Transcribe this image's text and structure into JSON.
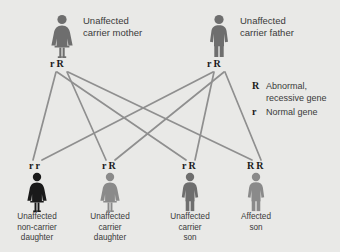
{
  "diagram": {
    "background_color": "#e9e9e7",
    "line_color": "#8f8f8f"
  },
  "parents": [
    {
      "id": "mother",
      "icon": "female-figure-icon",
      "color": "#6e6e6e",
      "genotype": [
        "r",
        "R"
      ],
      "label_line1": "Unaffected",
      "label_line2": "carrier mother"
    },
    {
      "id": "father",
      "icon": "male-figure-icon",
      "color": "#6e6e6e",
      "genotype": [
        "r",
        "R"
      ],
      "label_line1": "Unaffected",
      "label_line2": "carrier father"
    }
  ],
  "children": [
    {
      "id": "child-1",
      "icon": "female-figure-icon",
      "color": "#1a1a1a",
      "genotype": [
        "r",
        "r"
      ],
      "caption_lines": [
        "Unaffected",
        "non-carrier",
        "daughter"
      ]
    },
    {
      "id": "child-2",
      "icon": "female-figure-icon",
      "color": "#8a8a8a",
      "genotype": [
        "r",
        "R"
      ],
      "caption_lines": [
        "Unaffected",
        "carrier",
        "daughter"
      ]
    },
    {
      "id": "child-3",
      "icon": "male-figure-icon",
      "color": "#6e6e6e",
      "genotype": [
        "r",
        "R"
      ],
      "caption_lines": [
        "Unaffected",
        "carrier",
        "son"
      ]
    },
    {
      "id": "child-4",
      "icon": "male-figure-icon",
      "color": "#8a8a8a",
      "genotype": [
        "R",
        "R"
      ],
      "caption_lines": [
        "Affected",
        "son"
      ]
    }
  ],
  "legend": {
    "items": [
      {
        "key": "R",
        "text_line1": "Abnormal,",
        "text_line2": "recessive gene"
      },
      {
        "key": "r",
        "text_line1": "Normal gene",
        "text_line2": ""
      }
    ]
  }
}
